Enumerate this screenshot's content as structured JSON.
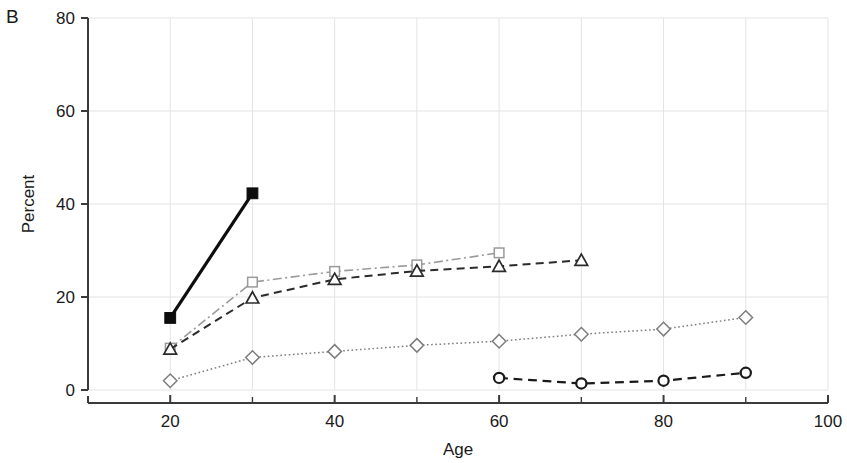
{
  "panel": {
    "label": "B"
  },
  "chart_data": {
    "type": "line",
    "title": "",
    "subtitle": "",
    "panel_label": "B",
    "xlabel": "Age",
    "ylabel": "Percent",
    "xlim": [
      10,
      100
    ],
    "ylim": [
      0,
      80
    ],
    "xticks": [
      20,
      40,
      60,
      80,
      100
    ],
    "xticklabels": [
      "20",
      "40",
      "60",
      "80",
      "100"
    ],
    "xminorticks": [
      10,
      30,
      50,
      70,
      90
    ],
    "yticks": [
      0,
      20,
      40,
      60,
      80
    ],
    "yticklabels": [
      "0",
      "20",
      "40",
      "60",
      "80"
    ],
    "grid": true,
    "grid_color": "#e3e3e3",
    "legend": "none",
    "axis_color": "#3a3a3a",
    "series": [
      {
        "name": "filled-square-series",
        "marker": "filled-square",
        "linestyle": "solid",
        "color": "#0d0d0d",
        "linewidth": 3.2,
        "x": [
          20,
          30
        ],
        "values": [
          15.5,
          42.3
        ]
      },
      {
        "name": "open-square-series",
        "marker": "open-square",
        "linestyle": "dash-dot",
        "color": "#9a9a9a",
        "linewidth": 1.6,
        "x": [
          20,
          30,
          40,
          50,
          60
        ],
        "values": [
          9.0,
          23.2,
          25.5,
          26.9,
          29.5
        ]
      },
      {
        "name": "open-triangle-series",
        "marker": "open-triangle",
        "linestyle": "dashed",
        "color": "#2b2b2b",
        "linewidth": 2.0,
        "x": [
          20,
          30,
          40,
          50,
          60,
          70
        ],
        "values": [
          8.8,
          19.8,
          23.8,
          25.6,
          26.6,
          27.9
        ]
      },
      {
        "name": "open-diamond-series",
        "marker": "open-diamond",
        "linestyle": "dotted",
        "color": "#7d7d7d",
        "linewidth": 1.5,
        "x": [
          20,
          30,
          40,
          50,
          60,
          70,
          80,
          90
        ],
        "values": [
          2.0,
          7.0,
          8.3,
          9.6,
          10.5,
          12.0,
          13.1,
          15.6
        ]
      },
      {
        "name": "open-circle-series",
        "marker": "open-circle",
        "linestyle": "dashed",
        "color": "#1a1a1a",
        "linewidth": 2.2,
        "x": [
          60,
          70,
          80,
          90
        ],
        "values": [
          2.6,
          1.4,
          2.0,
          3.7
        ]
      }
    ]
  }
}
